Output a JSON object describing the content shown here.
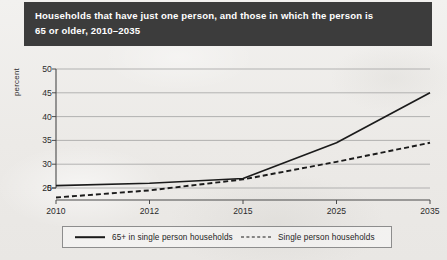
{
  "title": {
    "line1": "Households that have just one person, and those in which the person is",
    "line2": "65 or older, 2010–2035",
    "full": "Households that have just one person, and those in which the person is\n65 or older, 2010–2035",
    "banner_color": "#3c3c3c",
    "text_color": "#ffffff"
  },
  "legend": {
    "items": [
      {
        "label": "65+ in single person households",
        "style": "solid",
        "color": "#1b1b1b"
      },
      {
        "label": "Single person households",
        "style": "dashed",
        "color": "#1b1b1b"
      }
    ]
  },
  "chart_data": {
    "type": "line",
    "title": "Households that have just one person, and those in which the person is 65 or older, 2010–2035",
    "xlabel": "",
    "ylabel": "percent",
    "categories": [
      "2010",
      "2012",
      "2015",
      "2025",
      "2035"
    ],
    "x_tick_labels": [
      "2010",
      "2012",
      "2015",
      "2025",
      "2035"
    ],
    "y_tick_labels": [
      "0",
      "25",
      "30",
      "35",
      "40",
      "45",
      "50"
    ],
    "y_tick_values": [
      0,
      25,
      30,
      35,
      40,
      45,
      50
    ],
    "ylim": [
      0,
      50
    ],
    "axis_break": true,
    "axis_break_note": "y-axis is broken: 0 sits just below 25, scale is linear from 25 to 50",
    "grid": "horizontal",
    "legend_position": "bottom",
    "series": [
      {
        "name": "65+ in single person households",
        "style": "solid",
        "color": "#1b1b1b",
        "values": [
          25.5,
          26.0,
          27.0,
          34.5,
          45.0
        ]
      },
      {
        "name": "Single person households",
        "style": "dashed",
        "color": "#1b1b1b",
        "values": [
          23.0,
          24.5,
          26.8,
          30.5,
          34.5
        ]
      }
    ]
  }
}
